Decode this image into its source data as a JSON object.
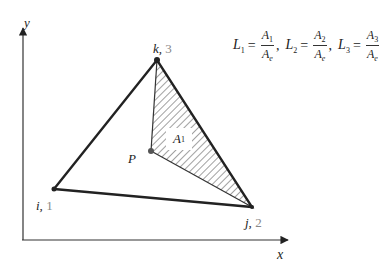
{
  "axes": {
    "x_label": "x",
    "y_label": "y"
  },
  "vertices": {
    "i": {
      "name": "i,",
      "index": "1"
    },
    "j": {
      "name": "j,",
      "index": "2"
    },
    "k": {
      "name": "k,",
      "index": "3"
    }
  },
  "point": {
    "label": "P"
  },
  "region": {
    "label_main": "A",
    "label_sub": "1"
  },
  "formula": {
    "terms": [
      {
        "lhs": "L",
        "lhs_sub": "1",
        "num": "A",
        "num_sub": "1",
        "den": "A",
        "den_sub": "e",
        "sep": ","
      },
      {
        "lhs": "L",
        "lhs_sub": "2",
        "num": "A",
        "num_sub": "2",
        "den": "A",
        "den_sub": "e",
        "sep": ","
      },
      {
        "lhs": "L",
        "lhs_sub": "3",
        "num": "A",
        "num_sub": "3",
        "den": "A",
        "den_sub": "e",
        "sep": ""
      }
    ],
    "equals": "="
  },
  "colors": {
    "line": "#222222",
    "hatch": "#444444",
    "index_text": "#888888"
  }
}
